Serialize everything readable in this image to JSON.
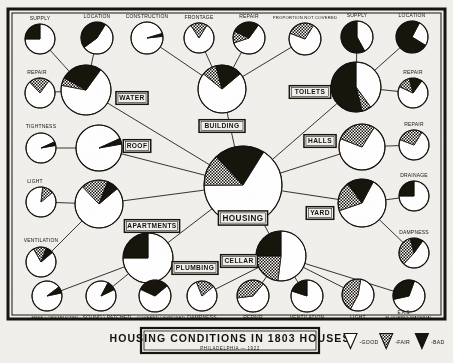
{
  "title": {
    "main": "HOUSING CONDITIONS IN 1803 HOUSES",
    "sub": "PHILADELPHIA — 1922",
    "initials": "E.A.S."
  },
  "legend": {
    "items": [
      {
        "key": "good",
        "label": "GOOD",
        "swatch": "white-wedge"
      },
      {
        "key": "fair",
        "label": "FAIR",
        "swatch": "hatched-wedge"
      },
      {
        "key": "bad",
        "label": "BAD",
        "swatch": "black-wedge"
      }
    ]
  },
  "colors": {
    "paper": "#f2f0ec",
    "ink": "#17120e",
    "good": "#ffffff",
    "fair": "#8a8176",
    "bad": "#17120e"
  },
  "chart_data": {
    "type": "pie",
    "title": "HOUSING CONDITIONS IN 1803 HOUSES",
    "subtitle": "PHILADELPHIA — 1922",
    "categories": [
      "GOOD",
      "FAIR",
      "BAD"
    ],
    "units": "percent of 1803 houses",
    "legend_position": "bottom-right",
    "grid": false,
    "nodes": [
      {
        "id": "housing",
        "label": "HOUSING",
        "level": "root",
        "cx": 243,
        "cy": 185,
        "r": 39,
        "values": {
          "good": 66,
          "fair": 13,
          "bad": 21
        }
      },
      {
        "id": "water",
        "label": "WATER",
        "level": "branch",
        "cx": 86,
        "cy": 90,
        "r": 25,
        "values": {
          "good": 68,
          "fair": 5,
          "bad": 27
        }
      },
      {
        "id": "roof",
        "label": "ROOF",
        "level": "branch",
        "cx": 99,
        "cy": 148,
        "r": 23,
        "values": {
          "good": 96,
          "fair": 0,
          "bad": 4
        }
      },
      {
        "id": "apartments",
        "label": "APARTMENTS",
        "level": "branch",
        "cx": 99,
        "cy": 204,
        "r": 24,
        "values": {
          "good": 74,
          "fair": 18,
          "bad": 8
        }
      },
      {
        "id": "plumbing",
        "label": "PLUMBING",
        "level": "branch",
        "cx": 148,
        "cy": 258,
        "r": 25,
        "values": {
          "good": 75,
          "fair": 0,
          "bad": 25
        }
      },
      {
        "id": "building",
        "label": "BUILDING",
        "level": "branch",
        "cx": 222,
        "cy": 89,
        "r": 24,
        "values": {
          "good": 72,
          "fair": 10,
          "bad": 18
        }
      },
      {
        "id": "cellar",
        "label": "CELLAR",
        "level": "branch",
        "cx": 281,
        "cy": 256,
        "r": 25,
        "values": {
          "good": 52,
          "fair": 23,
          "bad": 25
        }
      },
      {
        "id": "toilets",
        "label": "TOILETS",
        "level": "branch",
        "cx": 356,
        "cy": 87,
        "r": 25,
        "values": {
          "good": 40,
          "fair": 6,
          "bad": 54
        }
      },
      {
        "id": "halls",
        "label": "HALLS",
        "level": "branch",
        "cx": 362,
        "cy": 147,
        "r": 23,
        "values": {
          "good": 72,
          "fair": 28,
          "bad": 0
        }
      },
      {
        "id": "yard",
        "label": "YARD",
        "level": "branch",
        "cx": 362,
        "cy": 203,
        "r": 24,
        "values": {
          "good": 62,
          "fair": 20,
          "bad": 18
        }
      },
      {
        "id": "water-supply",
        "label": "SUPPLY",
        "level": "leaf",
        "cx": 40,
        "cy": 39,
        "r": 15,
        "values": {
          "good": 75,
          "fair": 0,
          "bad": 25
        }
      },
      {
        "id": "water-location",
        "label": "LOCATION",
        "level": "leaf",
        "cx": 97,
        "cy": 38,
        "r": 16,
        "values": {
          "good": 56,
          "fair": 0,
          "bad": 44
        }
      },
      {
        "id": "water-repair",
        "label": "REPAIR",
        "level": "leaf",
        "cx": 40,
        "cy": 93,
        "r": 15,
        "values": {
          "good": 78,
          "fair": 22,
          "bad": 0
        }
      },
      {
        "id": "roof-tightness",
        "label": "TIGHTNESS",
        "level": "leaf",
        "cx": 41,
        "cy": 148,
        "r": 15,
        "values": {
          "good": 96,
          "fair": 0,
          "bad": 4
        }
      },
      {
        "id": "apt-light",
        "label": "LIGHT",
        "level": "leaf",
        "cx": 41,
        "cy": 202,
        "r": 15,
        "values": {
          "good": 88,
          "fair": 12,
          "bad": 0
        }
      },
      {
        "id": "apt-ventilation",
        "label": "VENTILATION",
        "level": "leaf",
        "cx": 41,
        "cy": 262,
        "r": 15,
        "values": {
          "good": 78,
          "fair": 14,
          "bad": 8
        }
      },
      {
        "id": "plumb-free",
        "label": "FREE \\ OBSTRUCTED",
        "level": "leaf",
        "cx": 47,
        "cy": 296,
        "r": 15,
        "values": {
          "good": 93,
          "fair": 0,
          "bad": 7
        }
      },
      {
        "id": "plumb-sound",
        "label": "SOUND \\ PATCHED",
        "level": "leaf",
        "cx": 101,
        "cy": 296,
        "r": 15,
        "values": {
          "good": 90,
          "fair": 0,
          "bad": 10
        }
      },
      {
        "id": "plumb-covered",
        "label": "COVERED \\ EXPOSED",
        "level": "leaf",
        "cx": 155,
        "cy": 296,
        "r": 16,
        "values": {
          "good": 68,
          "fair": 0,
          "bad": 32
        }
      },
      {
        "id": "bld-construction",
        "label": "CONSTRUCTION",
        "level": "leaf",
        "cx": 147,
        "cy": 38,
        "r": 16,
        "values": {
          "good": 97,
          "fair": 0,
          "bad": 3
        }
      },
      {
        "id": "bld-frontage",
        "label": "FRONTAGE",
        "level": "leaf",
        "cx": 199,
        "cy": 38,
        "r": 15,
        "values": {
          "good": 82,
          "fair": 18,
          "bad": 0
        }
      },
      {
        "id": "bld-repair",
        "label": "REPAIR",
        "level": "leaf",
        "cx": 249,
        "cy": 38,
        "r": 16,
        "values": {
          "good": 60,
          "fair": 12,
          "bad": 28
        }
      },
      {
        "id": "bld-notcovered",
        "label": "PROPORTION NOT COVERED",
        "level": "leaf",
        "cx": 305,
        "cy": 39,
        "r": 16,
        "values": {
          "good": 72,
          "fair": 28,
          "bad": 0
        }
      },
      {
        "id": "cellar-dampness",
        "label": "DAMPNESS",
        "level": "leaf",
        "cx": 202,
        "cy": 296,
        "r": 15,
        "values": {
          "good": 80,
          "fair": 20,
          "bad": 0
        }
      },
      {
        "id": "cellar-repair",
        "label": "REPAIR",
        "level": "leaf",
        "cx": 253,
        "cy": 296,
        "r": 16,
        "values": {
          "good": 62,
          "fair": 38,
          "bad": 0
        }
      },
      {
        "id": "cellar-ventilation",
        "label": "VENTILATION",
        "level": "leaf",
        "cx": 307,
        "cy": 296,
        "r": 16,
        "values": {
          "good": 80,
          "fair": 0,
          "bad": 20
        }
      },
      {
        "id": "cellar-light",
        "label": "LIGHT",
        "level": "leaf",
        "cx": 358,
        "cy": 295,
        "r": 16,
        "values": {
          "good": 55,
          "fair": 45,
          "bad": 0
        }
      },
      {
        "id": "cellar-flooring",
        "label": "FLOORING MATERIAL",
        "level": "leaf",
        "cx": 409,
        "cy": 296,
        "r": 16,
        "values": {
          "good": 66,
          "fair": 0,
          "bad": 34
        }
      },
      {
        "id": "toilet-supply",
        "label": "SUPPLY",
        "level": "leaf",
        "cx": 357,
        "cy": 37,
        "r": 16,
        "values": {
          "good": 42,
          "fair": 0,
          "bad": 58
        }
      },
      {
        "id": "toilet-location",
        "label": "LOCATION",
        "level": "leaf",
        "cx": 412,
        "cy": 37,
        "r": 16,
        "values": {
          "good": 26,
          "fair": 0,
          "bad": 74
        }
      },
      {
        "id": "toilet-repair",
        "label": "REPAIR",
        "level": "leaf",
        "cx": 413,
        "cy": 93,
        "r": 15,
        "values": {
          "good": 72,
          "fair": 14,
          "bad": 14
        }
      },
      {
        "id": "halls-repair",
        "label": "REPAIR",
        "level": "leaf",
        "cx": 414,
        "cy": 145,
        "r": 15,
        "values": {
          "good": 72,
          "fair": 28,
          "bad": 0
        }
      },
      {
        "id": "yard-drainage",
        "label": "DRAINAGE",
        "level": "leaf",
        "cx": 414,
        "cy": 196,
        "r": 15,
        "values": {
          "good": 75,
          "fair": 0,
          "bad": 25
        }
      },
      {
        "id": "yard-dampness",
        "label": "DAMPNESS",
        "level": "leaf",
        "cx": 414,
        "cy": 253,
        "r": 15,
        "values": {
          "good": 52,
          "fair": 34,
          "bad": 14
        }
      }
    ],
    "edges": [
      [
        "housing",
        "water"
      ],
      [
        "housing",
        "roof"
      ],
      [
        "housing",
        "apartments"
      ],
      [
        "housing",
        "plumbing"
      ],
      [
        "housing",
        "building"
      ],
      [
        "housing",
        "cellar"
      ],
      [
        "housing",
        "toilets"
      ],
      [
        "housing",
        "halls"
      ],
      [
        "housing",
        "yard"
      ],
      [
        "water",
        "water-supply"
      ],
      [
        "water",
        "water-location"
      ],
      [
        "water",
        "water-repair"
      ],
      [
        "roof",
        "roof-tightness"
      ],
      [
        "apartments",
        "apt-light"
      ],
      [
        "apartments",
        "apt-ventilation"
      ],
      [
        "plumbing",
        "plumb-free"
      ],
      [
        "plumbing",
        "plumb-sound"
      ],
      [
        "plumbing",
        "plumb-covered"
      ],
      [
        "building",
        "bld-construction"
      ],
      [
        "building",
        "bld-frontage"
      ],
      [
        "building",
        "bld-repair"
      ],
      [
        "building",
        "bld-notcovered"
      ],
      [
        "cellar",
        "cellar-dampness"
      ],
      [
        "cellar",
        "cellar-repair"
      ],
      [
        "cellar",
        "cellar-ventilation"
      ],
      [
        "cellar",
        "cellar-light"
      ],
      [
        "cellar",
        "cellar-flooring"
      ],
      [
        "toilets",
        "toilet-supply"
      ],
      [
        "toilets",
        "toilet-location"
      ],
      [
        "toilets",
        "toilet-repair"
      ],
      [
        "halls",
        "halls-repair"
      ],
      [
        "yard",
        "yard-drainage"
      ],
      [
        "yard",
        "yard-dampness"
      ]
    ],
    "node_label_offsets": {
      "housing": {
        "dx": 0,
        "dy": 33
      },
      "water": {
        "dx": 46,
        "dy": 8
      },
      "roof": {
        "dx": 38,
        "dy": -2
      },
      "apartments": {
        "dx": 53,
        "dy": 22
      },
      "plumbing": {
        "dx": 47,
        "dy": 10
      },
      "building": {
        "dx": 0,
        "dy": 37
      },
      "cellar": {
        "dx": -42,
        "dy": 5
      },
      "toilets": {
        "dx": -46,
        "dy": 5
      },
      "halls": {
        "dx": -42,
        "dy": -6
      },
      "yard": {
        "dx": -42,
        "dy": 10
      }
    },
    "leaf_label_offsets": {
      "water-supply": {
        "dx": 0,
        "dy": -20
      },
      "water-location": {
        "dx": 0,
        "dy": -21
      },
      "water-repair": {
        "dx": -3,
        "dy": -20
      },
      "roof-tightness": {
        "dx": 0,
        "dy": -21
      },
      "apt-light": {
        "dx": -6,
        "dy": -20
      },
      "apt-ventilation": {
        "dx": 0,
        "dy": -21
      },
      "plumb-free": {
        "dx": 8,
        "dy": 22
      },
      "plumb-sound": {
        "dx": 6,
        "dy": 22
      },
      "plumb-covered": {
        "dx": 6,
        "dy": 22
      },
      "bld-construction": {
        "dx": 0,
        "dy": -21
      },
      "bld-frontage": {
        "dx": 0,
        "dy": -20
      },
      "bld-repair": {
        "dx": 0,
        "dy": -21
      },
      "bld-notcovered": {
        "dx": 0,
        "dy": -21
      },
      "cellar-dampness": {
        "dx": 0,
        "dy": 22
      },
      "cellar-repair": {
        "dx": 0,
        "dy": 22
      },
      "cellar-ventilation": {
        "dx": 0,
        "dy": 22
      },
      "cellar-light": {
        "dx": 0,
        "dy": 23
      },
      "cellar-flooring": {
        "dx": 0,
        "dy": 22
      },
      "toilet-supply": {
        "dx": 0,
        "dy": -21
      },
      "toilet-location": {
        "dx": 0,
        "dy": -21
      },
      "toilet-repair": {
        "dx": 0,
        "dy": -20
      },
      "halls-repair": {
        "dx": 0,
        "dy": -20
      },
      "yard-drainage": {
        "dx": 0,
        "dy": -20
      },
      "yard-dampness": {
        "dx": 0,
        "dy": -20
      }
    },
    "node_start_angle": {
      "housing": -58,
      "water": -54,
      "roof": -10,
      "apartments": -40,
      "plumbing": -90,
      "building": -40,
      "cellar": -90,
      "toilets": -90,
      "halls": -58,
      "yard": -62,
      "water-supply": -90,
      "water-location": -58,
      "water-repair": -54,
      "roof-tightness": -10,
      "apt-light": -40,
      "apt-ventilation": -40,
      "plumb-free": -12,
      "plumb-sound": -26,
      "plumb-covered": -40,
      "bld-construction": -6,
      "bld-frontage": -58,
      "bld-repair": -54,
      "bld-notcovered": -58,
      "cellar-dampness": -40,
      "cellar-repair": -50,
      "cellar-ventilation": -90,
      "cellar-light": -80,
      "cellar-flooring": -70,
      "toilet-supply": -90,
      "toilet-location": -62,
      "toilet-repair": -54,
      "halls-repair": -58,
      "yard-drainage": -90,
      "yard-dampness": -54
    }
  }
}
